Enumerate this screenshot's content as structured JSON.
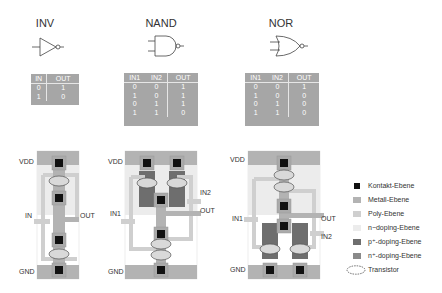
{
  "gates": [
    {
      "name": "INV",
      "symbol": "inverter",
      "truth_table": {
        "headers": [
          "IN",
          "OUT"
        ],
        "rows": [
          [
            "0",
            "1"
          ],
          [
            "1",
            "0"
          ]
        ]
      },
      "layout_labels": {
        "vdd": "VDD",
        "gnd": "GND",
        "in": "IN",
        "out": "OUT"
      }
    },
    {
      "name": "NAND",
      "symbol": "nand",
      "truth_table": {
        "headers": [
          "IN1",
          "IN2",
          "OUT"
        ],
        "rows": [
          [
            "0",
            "0",
            "1"
          ],
          [
            "1",
            "0",
            "1"
          ],
          [
            "0",
            "1",
            "1"
          ],
          [
            "1",
            "1",
            "0"
          ]
        ]
      },
      "layout_labels": {
        "vdd": "VDD",
        "gnd": "GND",
        "in1": "IN1",
        "in2": "IN2",
        "out": "OUT"
      }
    },
    {
      "name": "NOR",
      "symbol": "nor",
      "truth_table": {
        "headers": [
          "IN1",
          "IN2",
          "OUT"
        ],
        "rows": [
          [
            "0",
            "0",
            "1"
          ],
          [
            "1",
            "0",
            "0"
          ],
          [
            "0",
            "1",
            "0"
          ],
          [
            "1",
            "1",
            "0"
          ]
        ]
      },
      "layout_labels": {
        "vdd": "VDD",
        "gnd": "GND",
        "in1": "IN1",
        "in2": "IN2",
        "out": "OUT"
      }
    }
  ],
  "legend": [
    {
      "label": "Kontakt-Ebene",
      "color": "#111111",
      "icon": "square-swatch"
    },
    {
      "label": "Metall-Ebene",
      "color": "#b3b3b3",
      "icon": "rect-swatch"
    },
    {
      "label": "Poly-Ebene",
      "color": "#cfcfcf",
      "icon": "rect-swatch"
    },
    {
      "label": "n−doping-Ebene",
      "color": "#ececec",
      "icon": "rect-swatch"
    },
    {
      "label": "p⁺-doping-Ebene",
      "color": "#6e6e6e",
      "icon": "rect-swatch"
    },
    {
      "label": "n⁺-doping-Ebene",
      "color": "#8a8a8a",
      "icon": "rect-swatch"
    },
    {
      "label": "Transistor",
      "color": "#555555",
      "icon": "dashed-ellipse"
    }
  ],
  "colors": {
    "table_bg": "#a6a6a6",
    "metal": "#b3b3b3",
    "poly": "#cfcfcf",
    "nwell": "#ececec",
    "pplus": "#6e6e6e",
    "nplus": "#8a8a8a",
    "contact": "#111111",
    "transistor_fill": "#d9d9d9"
  }
}
